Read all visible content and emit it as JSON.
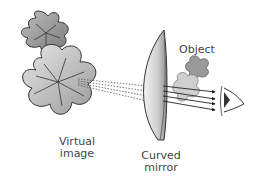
{
  "diagram": {
    "title": "",
    "labels": {
      "object": "Object",
      "virtual_image_line1": "Virtual",
      "virtual_image_line2": "image",
      "mirror_line1": "Curved",
      "mirror_line2": "mirror"
    },
    "elements": [
      "virtual-image-flowers",
      "curved-mirror",
      "object-flowers",
      "light-rays",
      "eye"
    ],
    "colors": {
      "flower_fill": "#c8c8c8",
      "flower_stroke": "#333333",
      "mirror_fill": "#d9d9d9",
      "ray": "#222222",
      "text": "#444444"
    }
  }
}
